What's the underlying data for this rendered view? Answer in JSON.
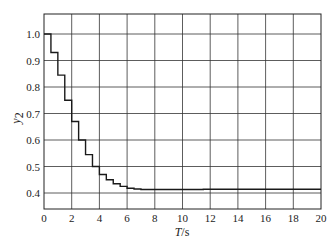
{
  "chart_data": {
    "type": "line",
    "style": "step",
    "title": "",
    "xlabel": "T/s",
    "ylabel": "y2",
    "xlim": [
      0,
      20
    ],
    "ylim": [
      0.35,
      1.07
    ],
    "x_ticks": [
      0,
      2,
      4,
      6,
      8,
      10,
      12,
      14,
      16,
      18,
      20
    ],
    "y_ticks": [
      0.4,
      0.5,
      0.6,
      0.7,
      0.8,
      0.9,
      1.0
    ],
    "x_tick_labels": [
      "0",
      "2",
      "4",
      "6",
      "8",
      "10",
      "12",
      "14",
      "16",
      "18",
      "20"
    ],
    "y_tick_labels": [
      "0.4",
      "0.5",
      "0.6",
      "0.7",
      "0.8",
      "0.9",
      "1.0"
    ],
    "grid": true,
    "legend": null,
    "series": [
      {
        "name": "y2",
        "color": "#1a1a1a",
        "x": [
          0,
          0.5,
          1.0,
          1.5,
          2.0,
          2.5,
          3.0,
          3.5,
          4.0,
          4.5,
          5.0,
          5.5,
          6.0,
          6.5,
          7.0,
          11.5,
          20
        ],
        "y": [
          1.0,
          0.93,
          0.845,
          0.75,
          0.67,
          0.6,
          0.545,
          0.5,
          0.47,
          0.45,
          0.435,
          0.425,
          0.418,
          0.415,
          0.413,
          0.414,
          0.414
        ]
      }
    ]
  },
  "axes": {
    "xlabel_main": "T",
    "xlabel_unit": "/s",
    "ylabel_main": "y",
    "ylabel_sub": "2"
  }
}
